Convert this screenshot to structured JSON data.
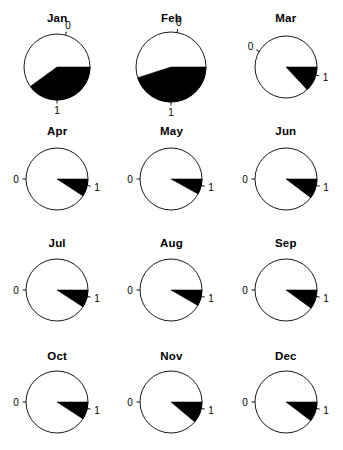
{
  "figure": {
    "type": "small-multiples-polar-wedge-grid",
    "columns": 3,
    "rows": 4,
    "background_color": "#ffffff",
    "wedge_color": "#000000",
    "outline_color": "#000000"
  },
  "chart_data": {
    "type": "pie",
    "title": "",
    "subtitle": "",
    "xlabel": "",
    "ylabel": "",
    "grid": false,
    "legend": null,
    "axis_tick_labels": [
      "0",
      "1"
    ],
    "axis_range": [
      0,
      1
    ],
    "categories": [
      "Jan",
      "Feb",
      "Mar",
      "Apr",
      "May",
      "Jun",
      "Jul",
      "Aug",
      "Sep",
      "Oct",
      "Nov",
      "Dec"
    ],
    "values": [
      0.4,
      0.45,
      0.13,
      0.09,
      0.08,
      0.1,
      0.09,
      0.08,
      0.1,
      0.09,
      0.11,
      0.1
    ],
    "panels": [
      {
        "label": "Jan",
        "value": 0.4,
        "wedge_start_deg": 0,
        "wedge_sweep_deg": 144,
        "tick_zero_deg": -75,
        "tick_one_deg": 90,
        "zero_label": "0",
        "one_label": "1",
        "radius": 33
      },
      {
        "label": "Feb",
        "value": 0.45,
        "wedge_start_deg": 0,
        "wedge_sweep_deg": 162,
        "tick_zero_deg": -80,
        "tick_one_deg": 90,
        "zero_label": "0",
        "one_label": "1",
        "radius": 35
      },
      {
        "label": "Mar",
        "value": 0.13,
        "wedge_start_deg": 0,
        "wedge_sweep_deg": 47,
        "tick_zero_deg": -150,
        "tick_one_deg": 15,
        "zero_label": "0",
        "one_label": "1",
        "radius": 31
      },
      {
        "label": "Apr",
        "value": 0.09,
        "wedge_start_deg": 0,
        "wedge_sweep_deg": 33,
        "tick_zero_deg": 180,
        "tick_one_deg": 12,
        "zero_label": "0",
        "one_label": "1",
        "radius": 31
      },
      {
        "label": "May",
        "value": 0.08,
        "wedge_start_deg": 0,
        "wedge_sweep_deg": 29,
        "tick_zero_deg": 180,
        "tick_one_deg": 12,
        "zero_label": "0",
        "one_label": "1",
        "radius": 31
      },
      {
        "label": "Jun",
        "value": 0.1,
        "wedge_start_deg": 0,
        "wedge_sweep_deg": 37,
        "tick_zero_deg": 180,
        "tick_one_deg": 12,
        "zero_label": "0",
        "one_label": "1",
        "radius": 31
      },
      {
        "label": "Jul",
        "value": 0.09,
        "wedge_start_deg": 0,
        "wedge_sweep_deg": 33,
        "tick_zero_deg": 180,
        "tick_one_deg": 12,
        "zero_label": "0",
        "one_label": "1",
        "radius": 31
      },
      {
        "label": "Aug",
        "value": 0.08,
        "wedge_start_deg": 0,
        "wedge_sweep_deg": 30,
        "tick_zero_deg": 180,
        "tick_one_deg": 12,
        "zero_label": "0",
        "one_label": "1",
        "radius": 31
      },
      {
        "label": "Sep",
        "value": 0.1,
        "wedge_start_deg": 0,
        "wedge_sweep_deg": 36,
        "tick_zero_deg": 180,
        "tick_one_deg": 12,
        "zero_label": "0",
        "one_label": "1",
        "radius": 31
      },
      {
        "label": "Oct",
        "value": 0.09,
        "wedge_start_deg": 0,
        "wedge_sweep_deg": 33,
        "tick_zero_deg": 180,
        "tick_one_deg": 12,
        "zero_label": "0",
        "one_label": "1",
        "radius": 31
      },
      {
        "label": "Nov",
        "value": 0.11,
        "wedge_start_deg": 0,
        "wedge_sweep_deg": 40,
        "tick_zero_deg": 180,
        "tick_one_deg": 12,
        "zero_label": "0",
        "one_label": "1",
        "radius": 31
      },
      {
        "label": "Dec",
        "value": 0.1,
        "wedge_start_deg": 0,
        "wedge_sweep_deg": 37,
        "tick_zero_deg": 180,
        "tick_one_deg": 12,
        "zero_label": "0",
        "one_label": "1",
        "radius": 31
      }
    ]
  }
}
